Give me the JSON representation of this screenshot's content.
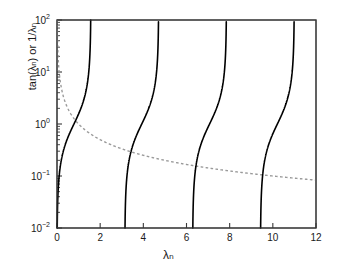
{
  "chart_data": {
    "type": "line",
    "title": "",
    "subtitle": "",
    "xlabel": "λₙ",
    "ylabel": "tan(λₙ) or 1/λₙ",
    "xlim": [
      0,
      12
    ],
    "ylim": [
      0.01,
      100
    ],
    "yscale": "log",
    "xscale": "linear",
    "grid": false,
    "legend": "none",
    "xticks": [
      0,
      2,
      4,
      6,
      8,
      10,
      12
    ],
    "xticklabels": [
      "0",
      "2",
      "4",
      "6",
      "8",
      "10",
      "12"
    ],
    "yticks": [
      0.01,
      0.1,
      1,
      10,
      100
    ],
    "yticklabels": [
      "10⁻²",
      "10⁻¹",
      "10⁰",
      "10¹",
      "10²"
    ],
    "yticklabel_parts": [
      {
        "base": "10",
        "exp": "-2"
      },
      {
        "base": "10",
        "exp": "-1"
      },
      {
        "base": "10",
        "exp": "0"
      },
      {
        "base": "10",
        "exp": "1"
      },
      {
        "base": "10",
        "exp": "2"
      }
    ],
    "minor_ticks_y": true,
    "series": [
      {
        "name": "tan(λₙ)",
        "style": "solid",
        "color": "#000000",
        "linewidth": 1.6,
        "branches": [
          {
            "x_start": 0.01,
            "x_end": 1.5608,
            "note": "branch 0: asymptote at π/2"
          },
          {
            "x_start": 3.1516,
            "x_end": 4.7016,
            "note": "branch 1: from π to 3π/2"
          },
          {
            "x_start": 6.2932,
            "x_end": 7.8432,
            "note": "branch 2: from 2π to 5π/2"
          },
          {
            "x_start": 9.4348,
            "x_end": 10.9848,
            "note": "branch 3: from 3π to 7π/2"
          }
        ]
      },
      {
        "name": "1/λₙ",
        "style": "dashed",
        "color": "#9a9a9a",
        "linewidth": 1.4,
        "x_start": 0.01,
        "x_end": 12,
        "sample_points": [
          {
            "x": 0.01,
            "y": 100
          },
          {
            "x": 0.1,
            "y": 10
          },
          {
            "x": 0.5,
            "y": 2.0
          },
          {
            "x": 1.0,
            "y": 1.0
          },
          {
            "x": 2.0,
            "y": 0.5
          },
          {
            "x": 3.1416,
            "y": 0.3183
          },
          {
            "x": 4.0,
            "y": 0.25
          },
          {
            "x": 6.2832,
            "y": 0.1592
          },
          {
            "x": 8.0,
            "y": 0.125
          },
          {
            "x": 9.4248,
            "y": 0.1061
          },
          {
            "x": 12.0,
            "y": 0.0833
          }
        ]
      }
    ],
    "intersections": [
      {
        "x": 0.8603,
        "y": 1.1623
      },
      {
        "x": 3.4256,
        "y": 0.2919
      },
      {
        "x": 6.4373,
        "y": 0.1553
      },
      {
        "x": 9.5293,
        "y": 0.1049
      }
    ]
  },
  "axes": {
    "spine_color": "#3a3a3a",
    "background": "#ffffff"
  }
}
